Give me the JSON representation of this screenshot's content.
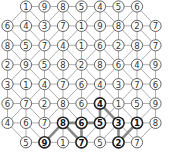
{
  "puzzle": {
    "rows": 8,
    "cols": 9,
    "grid": [
      [
        null,
        1,
        9,
        8,
        5,
        4,
        5,
        6,
        null
      ],
      [
        6,
        4,
        3,
        7,
        1,
        9,
        8,
        2,
        7
      ],
      [
        8,
        5,
        7,
        4,
        1,
        6,
        2,
        8,
        7
      ],
      [
        2,
        9,
        5,
        8,
        2,
        8,
        6,
        4,
        9
      ],
      [
        3,
        1,
        4,
        7,
        6,
        4,
        3,
        7,
        6
      ],
      [
        6,
        7,
        2,
        8,
        6,
        4,
        1,
        5,
        9
      ],
      [
        4,
        6,
        7,
        8,
        6,
        5,
        3,
        1,
        8
      ],
      [
        null,
        5,
        9,
        1,
        7,
        5,
        2,
        7,
        null
      ]
    ],
    "diagonals": [
      [
        "/",
        "\\",
        "/",
        "\\",
        "/",
        "\\",
        "/",
        "\\"
      ],
      [
        "\\",
        "\\",
        "/",
        "/",
        "\\",
        "/",
        "\\",
        "\\"
      ],
      [
        "\\",
        "/",
        "/",
        "\\",
        "/",
        "\\",
        "/",
        "/"
      ],
      [
        "/",
        "\\",
        "\\",
        "/",
        "\\",
        "/",
        "\\",
        "\\"
      ],
      [
        "\\",
        "/",
        "\\",
        "/",
        "/",
        "\\",
        "/",
        "\\"
      ],
      [
        "/",
        "\\",
        "/",
        "\\",
        "\\",
        "/",
        "\\",
        "/"
      ],
      [
        "\\",
        "\\",
        "/",
        "\\",
        "/",
        "/",
        "\\",
        "/"
      ]
    ],
    "highlighted_path": [
      [
        7,
        2
      ],
      [
        6,
        3
      ],
      [
        7,
        4
      ],
      [
        6,
        4
      ],
      [
        6,
        5
      ],
      [
        5,
        5
      ],
      [
        6,
        6
      ],
      [
        7,
        6
      ],
      [
        6,
        7
      ]
    ],
    "highlighted_extra_edges": [
      [
        [
          6,
          4
        ],
        [
          6,
          3
        ]
      ]
    ],
    "bold_nodes": [
      [
        5,
        5
      ],
      [
        6,
        3
      ],
      [
        6,
        4
      ],
      [
        6,
        5
      ],
      [
        6,
        6
      ],
      [
        6,
        7
      ],
      [
        7,
        2
      ],
      [
        7,
        4
      ],
      [
        7,
        6
      ]
    ],
    "colors": {
      "edge": "#999999",
      "path": "#888888",
      "node_stroke": "#555555",
      "bold_stroke": "#222222"
    }
  }
}
